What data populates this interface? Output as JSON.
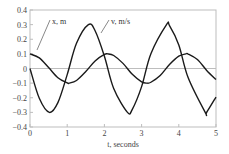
{
  "chart_data": {
    "type": "line",
    "title": "",
    "xlabel": "t, seconds",
    "ylabel": "",
    "xlim": [
      0,
      5
    ],
    "ylim": [
      -0.4,
      0.4
    ],
    "xticks": [
      0,
      1,
      2,
      3,
      4,
      5
    ],
    "yticks": [
      0.4,
      0.3,
      0.2,
      0.1,
      0,
      -0.1,
      -0.2,
      -0.3,
      -0.4
    ],
    "ytick_labels": [
      "0.4",
      "0.3",
      "0.2",
      "0.1",
      "0",
      "−0.1",
      "−0.2",
      "−0.3",
      "−0.4"
    ],
    "xtick_labels": [
      "0",
      "1",
      "2",
      "3",
      "4",
      "5"
    ],
    "grid": false,
    "zero_line": true,
    "legend": "inline leader-line labels near top",
    "series": [
      {
        "name": "x, m",
        "label": "x, m",
        "description": "displacement, approx 0.1*cos(3t)",
        "x": [
          0,
          0.25,
          0.5,
          0.75,
          1.0,
          1.05,
          1.25,
          1.5,
          1.75,
          2.0,
          2.09,
          2.25,
          2.5,
          2.75,
          3.0,
          3.14,
          3.25,
          3.5,
          3.75,
          4.0,
          4.19,
          4.25,
          4.5,
          4.75,
          5.0
        ],
        "values": [
          0.1,
          0.073,
          0.007,
          -0.063,
          -0.099,
          -0.1,
          -0.082,
          -0.021,
          0.052,
          0.096,
          0.1,
          0.089,
          0.035,
          -0.04,
          -0.091,
          -0.1,
          -0.094,
          -0.048,
          0.027,
          0.084,
          0.1,
          0.099,
          0.061,
          -0.013,
          -0.076
        ]
      },
      {
        "name": "v, m/s",
        "label": "v, m/s",
        "description": "velocity, approx -0.3*sin(3t)",
        "x": [
          0,
          0.25,
          0.52,
          0.75,
          1.0,
          1.25,
          1.57,
          1.75,
          2.0,
          2.25,
          2.62,
          2.75,
          3.0,
          3.25,
          3.67,
          3.75,
          4.0,
          4.25,
          4.71,
          4.75,
          5.0
        ],
        "values": [
          0,
          -0.204,
          -0.3,
          -0.233,
          -0.042,
          0.172,
          0.3,
          0.258,
          0.084,
          -0.137,
          -0.3,
          -0.279,
          -0.124,
          0.101,
          0.3,
          0.293,
          0.161,
          -0.062,
          -0.3,
          -0.299,
          -0.195
        ]
      }
    ]
  },
  "colors": {
    "axis": "#bdbdbd",
    "curve": "#1a1a1a",
    "text": "#444444"
  }
}
